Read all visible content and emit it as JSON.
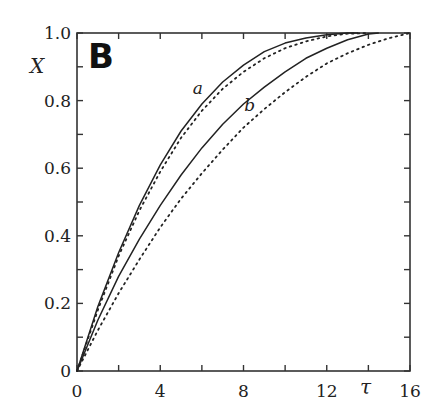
{
  "chart_data": {
    "type": "line",
    "title": "",
    "panel_label": "B",
    "xlabel": "τ",
    "ylabel": "X",
    "xlim": [
      0,
      16
    ],
    "ylim": [
      0,
      1.0
    ],
    "x_ticks": [
      0,
      4,
      8,
      12,
      16
    ],
    "x_tick_labels": [
      "0",
      "4",
      "8",
      "12",
      "16"
    ],
    "y_ticks": [
      0,
      0.2,
      0.4,
      0.6,
      0.8,
      1.0
    ],
    "y_tick_labels": [
      "0",
      "0.2",
      "0.4",
      "0.6",
      "0.8",
      "1.0"
    ],
    "grid": false,
    "legend": "none (curves labeled inline)",
    "annotations": [
      {
        "text": "a",
        "x": 5.8,
        "y": 0.82
      },
      {
        "text": "b",
        "x": 8.3,
        "y": 0.77
      }
    ],
    "series": [
      {
        "name": "a (solid)",
        "style": "solid",
        "x": [
          0,
          1,
          2,
          3,
          4,
          5,
          6,
          7,
          8,
          9,
          10,
          11,
          12,
          13,
          13.5
        ],
        "y": [
          0,
          0.19,
          0.35,
          0.49,
          0.61,
          0.71,
          0.79,
          0.855,
          0.905,
          0.945,
          0.97,
          0.985,
          0.995,
          1.0,
          1.0
        ]
      },
      {
        "name": "a (dotted)",
        "style": "dotted",
        "x": [
          0,
          1,
          2,
          3,
          4,
          5,
          6,
          7,
          8,
          9,
          10,
          11,
          12,
          13,
          14
        ],
        "y": [
          0,
          0.18,
          0.34,
          0.475,
          0.59,
          0.69,
          0.77,
          0.835,
          0.885,
          0.925,
          0.955,
          0.975,
          0.99,
          0.998,
          1.0
        ]
      },
      {
        "name": "b (solid)",
        "style": "solid",
        "x": [
          0,
          1,
          2,
          3,
          4,
          5,
          6,
          7,
          8,
          9,
          10,
          11,
          12,
          13,
          14,
          14.5
        ],
        "y": [
          0,
          0.15,
          0.28,
          0.39,
          0.49,
          0.58,
          0.66,
          0.73,
          0.79,
          0.84,
          0.885,
          0.925,
          0.955,
          0.98,
          0.997,
          1.0
        ]
      },
      {
        "name": "b (dotted)",
        "style": "dotted",
        "x": [
          0,
          1,
          2,
          3,
          4,
          5,
          6,
          7,
          8,
          9,
          10,
          11,
          12,
          13,
          14,
          15,
          16
        ],
        "y": [
          0,
          0.12,
          0.23,
          0.33,
          0.425,
          0.51,
          0.585,
          0.655,
          0.72,
          0.775,
          0.825,
          0.87,
          0.91,
          0.94,
          0.965,
          0.985,
          1.0
        ]
      }
    ]
  }
}
